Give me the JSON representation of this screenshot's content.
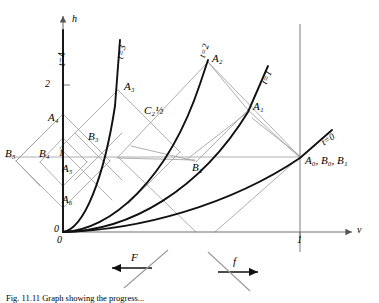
{
  "figure": {
    "caption": "Fig. 11.11   Graph showing the progress...",
    "axes": {
      "x_label": "v",
      "y_label": "h",
      "x_ticks": [
        {
          "value": 1,
          "label": "1"
        }
      ],
      "y_ticks": [
        {
          "value": 2,
          "label": "2"
        }
      ],
      "origin_label": "0",
      "origin_label_y": "0"
    },
    "curves": [
      {
        "name": "t=0",
        "label": "t=0",
        "t": 0
      },
      {
        "name": "t=1",
        "label": "t=1",
        "t": 1
      },
      {
        "name": "t=2",
        "label": "t=2",
        "t": 2
      },
      {
        "name": "t=3",
        "label": "t=3",
        "t": 3
      },
      {
        "name": "t=4",
        "label": "t=4",
        "t": 4
      }
    ],
    "points": [
      {
        "name": "A0-B0-B1",
        "label": "A",
        "sub": "0",
        "extra": ", B",
        "extra_sub": "0",
        "extra2": ", B",
        "extra2_sub": "1"
      },
      {
        "name": "A1",
        "label": "A",
        "sub": "1"
      },
      {
        "name": "A2",
        "label": "A",
        "sub": "2"
      },
      {
        "name": "A3",
        "label": "A",
        "sub": "3"
      },
      {
        "name": "A4",
        "label": "A",
        "sub": "4"
      },
      {
        "name": "A5",
        "label": "A",
        "sub": "5"
      },
      {
        "name": "A6",
        "label": "A",
        "sub": "6"
      },
      {
        "name": "B2",
        "label": "B",
        "sub": "2"
      },
      {
        "name": "B3",
        "label": "B",
        "sub": "3"
      },
      {
        "name": "B4",
        "label": "B",
        "sub": "4"
      },
      {
        "name": "B5",
        "label": "B",
        "sub": "5"
      },
      {
        "name": "C2half",
        "label": "C",
        "sub": "2½"
      }
    ],
    "point_labels": {
      "a0b0b1": "A₀, B₀, B₁",
      "a1": "A₁",
      "a2": "A₂",
      "a3": "A₃",
      "a4": "A₄",
      "a5": "A₅",
      "a6": "A₆",
      "b2": "B₂",
      "b3": "B₃",
      "b4": "B₄",
      "b5": "B₅",
      "c2": "C₂½"
    },
    "flow_arrows": [
      {
        "name": "F",
        "label": "F",
        "direction": "left"
      },
      {
        "name": "f",
        "label": "f",
        "direction": "right"
      }
    ],
    "colors": {
      "curve": "#000000",
      "lattice": "#9a9a9a",
      "axis": "#6e6e6e",
      "text": "#000000"
    }
  }
}
